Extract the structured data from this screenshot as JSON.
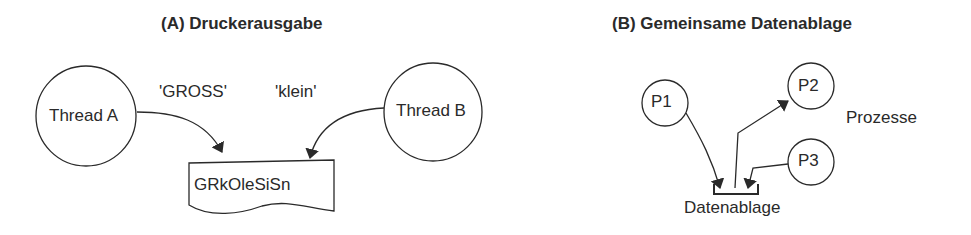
{
  "panel_a": {
    "title": "(A) Druckerausgabe",
    "thread_a": "Thread A",
    "thread_b": "Thread B",
    "string_a": "'GROSS'",
    "string_b": "'klein'",
    "output": "GRkOleSiSn"
  },
  "panel_b": {
    "title": "(B) Gemeinsame Datenablage",
    "p1": "P1",
    "p2": "P2",
    "p3": "P3",
    "processes_label": "Prozesse",
    "storage_label": "Datenablage"
  },
  "colors": {
    "stroke": "#2a2a2a",
    "background": "#ffffff"
  }
}
